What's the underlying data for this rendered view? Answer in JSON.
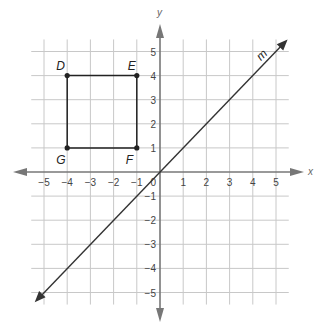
{
  "chart_data": {
    "type": "coordinate-plane",
    "xlabel": "x",
    "ylabel": "y",
    "xlim": [
      -5,
      5
    ],
    "ylim": [
      -5,
      5
    ],
    "grid": true,
    "x_ticks": [
      "−5",
      "−4",
      "−3",
      "−2",
      "−1",
      "1",
      "2",
      "3",
      "4",
      "5"
    ],
    "y_ticks": [
      "5",
      "4",
      "3",
      "2",
      "1",
      "−1",
      "−2",
      "−3",
      "−4",
      "−5"
    ],
    "origin_label": "0",
    "polygon": {
      "vertices": [
        {
          "name": "D",
          "x": -4,
          "y": 4
        },
        {
          "name": "E",
          "x": -1,
          "y": 4
        },
        {
          "name": "F",
          "x": -1,
          "y": 1
        },
        {
          "name": "G",
          "x": -4,
          "y": 1
        }
      ]
    },
    "line": {
      "name": "m",
      "equation": "y = x",
      "through": [
        [
          -5,
          -5
        ],
        [
          5,
          5
        ]
      ]
    }
  },
  "labels": {
    "x_axis": "x",
    "y_axis": "y",
    "line_m": "m",
    "D": "D",
    "E": "E",
    "F": "F",
    "G": "G",
    "origin": "0"
  },
  "colors": {
    "grid": "#c8c8c8",
    "axis": "#777777",
    "figure": "#222222"
  }
}
